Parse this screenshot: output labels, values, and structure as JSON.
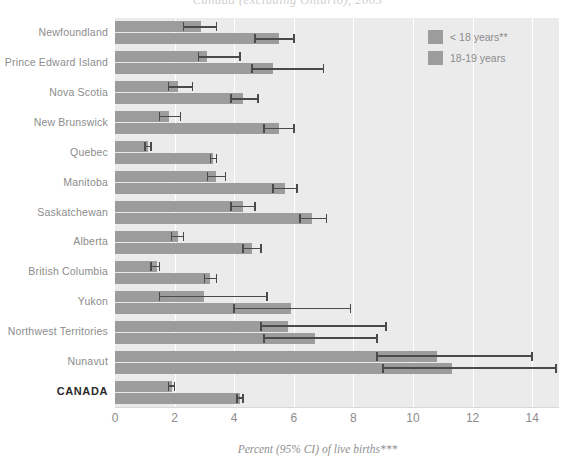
{
  "title": "Canada (excluding Ontario), 2005",
  "legend": {
    "position": "top-right",
    "items": [
      {
        "label": "< 18 years**",
        "color": "#9c9c9c"
      },
      {
        "label": "18-19 years",
        "color": "#9c9c9c"
      }
    ]
  },
  "axis": {
    "x_title": "Percent (95% CI) of live births***",
    "ticks": [
      0,
      2,
      4,
      6,
      8,
      10,
      12,
      14
    ],
    "xlim": [
      0,
      14.9
    ]
  },
  "colors": {
    "bar": "#9c9c9c",
    "plot_background": "#ebebeb",
    "gridline": "#ffffff",
    "error_bar": "#4a4a4a",
    "label": "#8c8c8c"
  },
  "chart_data": {
    "type": "bar",
    "orientation": "horizontal",
    "title": "Canada (excluding Ontario), 2005",
    "xlabel": "Percent (95% CI) of live births***",
    "ylabel": "",
    "xlim": [
      0,
      14.9
    ],
    "grid": true,
    "legend_position": "top-right",
    "categories": [
      "Newfoundland",
      "Prince Edward Island",
      "Nova Scotia",
      "New Brunswick",
      "Quebec",
      "Manitoba",
      "Saskatchewan",
      "Alberta",
      "British Columbia",
      "Yukon",
      "Northwest Territories",
      "Nunavut",
      "CANADA"
    ],
    "series": [
      {
        "name": "< 18 years**",
        "values": [
          2.9,
          3.1,
          2.1,
          1.8,
          1.1,
          3.4,
          4.3,
          2.1,
          1.4,
          3.0,
          5.8,
          10.8,
          1.9
        ],
        "ci_lower": [
          2.3,
          2.8,
          1.8,
          1.5,
          1.0,
          3.1,
          3.9,
          1.9,
          1.2,
          1.5,
          4.9,
          8.8,
          1.8
        ],
        "ci_upper": [
          3.4,
          4.2,
          2.6,
          2.2,
          1.2,
          3.7,
          4.7,
          2.3,
          1.5,
          5.1,
          9.1,
          14.0,
          2.0
        ]
      },
      {
        "name": "18-19 years",
        "values": [
          5.5,
          5.3,
          4.3,
          5.5,
          3.3,
          5.7,
          6.6,
          4.6,
          3.2,
          5.9,
          6.7,
          11.3,
          4.2
        ],
        "ci_lower": [
          4.7,
          4.6,
          3.9,
          5.0,
          3.2,
          5.3,
          6.2,
          4.3,
          3.0,
          4.0,
          5.0,
          9.0,
          4.1
        ],
        "ci_upper": [
          6.0,
          7.0,
          4.8,
          6.0,
          3.4,
          6.1,
          7.1,
          4.9,
          3.4,
          7.9,
          8.8,
          14.8,
          4.3
        ]
      }
    ]
  }
}
